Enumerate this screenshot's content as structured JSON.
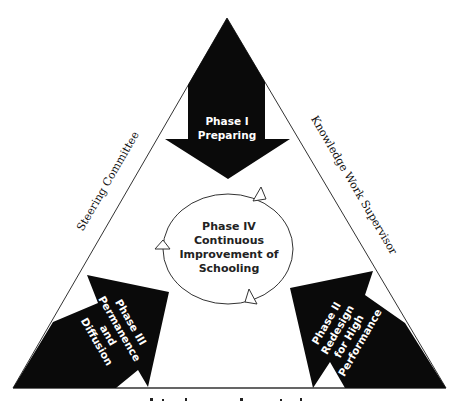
{
  "diagram": {
    "colors": {
      "background": "#ffffff",
      "arrow_fill": "#0a0a0a",
      "line": "#333333",
      "arrow_text": "#ffffff",
      "center_text": "#222222"
    },
    "side_labels": {
      "left": "Steering Committee",
      "right": "Knowledge Work Supervisor",
      "bottom": ""
    },
    "phases": {
      "phase1": {
        "line1": "Phase I",
        "line2": "Preparing"
      },
      "phase2": {
        "line1": "Phase II",
        "line2": "Redesign",
        "line3": "for High",
        "line4": "Performance"
      },
      "phase3": {
        "line1": "Phase III",
        "line2": "Permanence",
        "line3": "and",
        "line4": "Diffusion"
      },
      "phase4": {
        "line1": "Phase IV",
        "line2": "Continuous",
        "line3": "Improvement of",
        "line4": "Schooling"
      }
    }
  }
}
